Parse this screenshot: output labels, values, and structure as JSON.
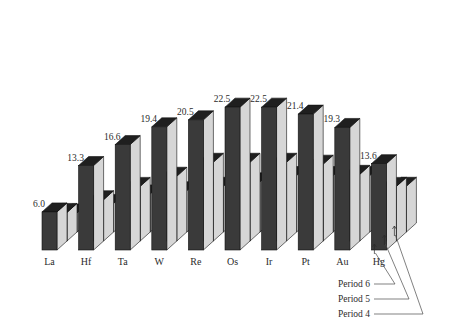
{
  "chart_data": {
    "type": "bar",
    "title": "",
    "subtitle": "",
    "xlabel": "",
    "ylabel": "",
    "grid": false,
    "legend_position": "bottom-right",
    "orientation": "vertical-3d-grouped",
    "categories": [
      "La",
      "Hf",
      "Ta",
      "W",
      "Re",
      "Os",
      "Ir",
      "Pt",
      "Au",
      "Hg"
    ],
    "value_labels": [
      "6.0",
      "13.3",
      "16.6",
      "19.4",
      "20.5",
      "22.5",
      "22.5",
      "21.4",
      "19.3",
      "13.6"
    ],
    "series": [
      {
        "name": "Period 6",
        "values": [
          6.0,
          13.3,
          16.6,
          19.4,
          20.5,
          22.5,
          22.5,
          21.4,
          19.3,
          13.6
        ],
        "labeled": true
      },
      {
        "name": "Period 5",
        "values": [
          4.5,
          6.5,
          8.6,
          10.2,
          12.4,
          12.4,
          12.4,
          12.1,
          10.5,
          8.6
        ]
      },
      {
        "name": "Period 4",
        "values": [
          3.0,
          4.5,
          6.0,
          6.5,
          7.2,
          7.9,
          8.9,
          8.9,
          8.9,
          7.2
        ]
      }
    ],
    "ylim": [
      0,
      24
    ],
    "legend_entries": [
      "Period 6",
      "Period 5",
      "Period 4"
    ],
    "colors": {
      "front_face": "#3a3a3a",
      "side_face": "#d6d6d6",
      "top_face": "#1f1f1f",
      "outline": "#111111",
      "background": "#ffffff",
      "text": "#2b2b2b"
    }
  },
  "legend": {
    "items": [
      {
        "label": "Period 6"
      },
      {
        "label": "Period 5"
      },
      {
        "label": "Period 4"
      }
    ]
  },
  "axis": {
    "categories": [
      {
        "label": "La"
      },
      {
        "label": "Hf"
      },
      {
        "label": "Ta"
      },
      {
        "label": "W"
      },
      {
        "label": "Re"
      },
      {
        "label": "Os"
      },
      {
        "label": "Ir"
      },
      {
        "label": "Pt"
      },
      {
        "label": "Au"
      },
      {
        "label": "Hg"
      }
    ]
  }
}
